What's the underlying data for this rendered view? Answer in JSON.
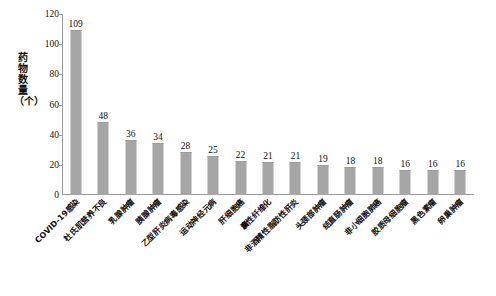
{
  "chart_data": {
    "type": "bar",
    "title": "",
    "xlabel": "",
    "ylabel": "药物数量（个）",
    "ylim": [
      0,
      120
    ],
    "ytick_labels": [
      "120",
      "100",
      "80",
      "60",
      "40",
      "20",
      "0"
    ],
    "ytick_values": [
      120,
      100,
      80,
      60,
      40,
      20,
      0
    ],
    "grid": false,
    "legend": "none",
    "bar_color": "#a6a6a6",
    "axis_color": "#9a9a9a",
    "background_color": "#ffffff",
    "categories": [
      "COVID-19感染",
      "杜氏肌营养不良",
      "乳腺肿瘤",
      "胰腺肿瘤",
      "乙型肝炎病毒感染",
      "运动神经元病",
      "肝细胞癌",
      "囊性纤维化",
      "非酒精性脂肪性肝炎",
      "头颈部肿瘤",
      "结直肠肿瘤",
      "非小细胞肺癌",
      "胶质母细胞瘤",
      "黑色素瘤",
      "卵巢肿瘤"
    ],
    "values": [
      109,
      48,
      36,
      34,
      28,
      25,
      22,
      21,
      21,
      19,
      18,
      18,
      16,
      16,
      16
    ],
    "data_labels": [
      "109",
      "48",
      "36",
      "34",
      "28",
      "25",
      "22",
      "21",
      "21",
      "19",
      "18",
      "18",
      "16",
      "16",
      "16"
    ]
  },
  "y_axis_title_chars": [
    "药",
    "物",
    "数",
    "量",
    "（个）"
  ]
}
